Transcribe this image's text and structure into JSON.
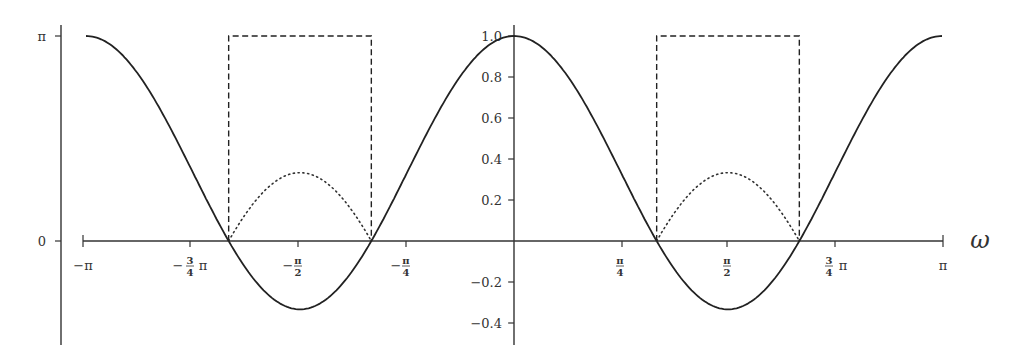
{
  "chart_data": {
    "type": "line",
    "title": "",
    "xlabel": "ω",
    "ylabel_left": "",
    "ylabel_right": "",
    "xlim": [
      -3.14159,
      3.14159
    ],
    "ylim": [
      -0.5,
      1.05
    ],
    "grid": false,
    "legend": "none",
    "x_ticks": [
      {
        "value": -3.14159,
        "label": "−π"
      },
      {
        "value": -2.35619,
        "label": "−¾π"
      },
      {
        "value": -1.5708,
        "label": "−π/2"
      },
      {
        "value": -0.7854,
        "label": "−π/4"
      },
      {
        "value": 0.7854,
        "label": "π/4"
      },
      {
        "value": 1.5708,
        "label": "π/2"
      },
      {
        "value": 2.35619,
        "label": "¾π"
      },
      {
        "value": 3.14159,
        "label": "π"
      }
    ],
    "y_ticks_right": [
      {
        "value": 1.0,
        "label": "1.0"
      },
      {
        "value": 0.8,
        "label": "0.8"
      },
      {
        "value": 0.6,
        "label": "0.6"
      },
      {
        "value": 0.4,
        "label": "0.4"
      },
      {
        "value": 0.2,
        "label": "0.2"
      },
      {
        "value": -0.2,
        "label": "-0.2"
      },
      {
        "value": -0.4,
        "label": "-0.4"
      }
    ],
    "y_ticks_left": [
      {
        "value": 1.0,
        "label": "π"
      },
      {
        "value": 0.0,
        "label": "0"
      }
    ],
    "series": [
      {
        "name": "H(ω) = (1 + 2cos 2ω)/3",
        "style": "solid",
        "x": [
          -3.14159,
          -2.61799,
          -2.0944,
          -1.5708,
          -1.0472,
          -0.5236,
          0,
          0.5236,
          1.0472,
          1.5708,
          2.0944,
          2.61799,
          3.14159
        ],
        "values": [
          1.0,
          0.667,
          0.0,
          -0.333,
          0.0,
          0.667,
          1.0,
          0.667,
          0.0,
          -0.333,
          0.0,
          0.667,
          1.0
        ]
      },
      {
        "name": "|H(ω)| (where H<0)",
        "style": "dotted",
        "x": [
          -2.0944,
          -1.8326,
          -1.5708,
          -1.309,
          -1.0472,
          1.0472,
          1.309,
          1.5708,
          1.8326,
          2.0944
        ],
        "values": [
          0.0,
          0.244,
          0.333,
          0.244,
          0.0,
          0.0,
          0.244,
          0.333,
          0.244,
          0.0
        ]
      },
      {
        "name": "phase ∠H(ω)",
        "style": "dashed",
        "x": [
          -2.0944,
          -2.0944,
          -1.0472,
          -1.0472,
          1.0472,
          1.0472,
          2.0944,
          2.0944
        ],
        "values": [
          0,
          3.14159,
          3.14159,
          0,
          0,
          3.14159,
          3.14159,
          0
        ]
      }
    ]
  },
  "labels": {
    "omega": "ω",
    "left_pi": "π",
    "left_zero": "0",
    "x_neg_pi": "−π",
    "x_neg_3_4": "3",
    "x_neg_3_4_den": "4",
    "x_pi_sym": "π",
    "x_minus": "−",
    "x_pi_num": "π",
    "x_den_2": "2",
    "x_den_4": "4",
    "y_1_0": "1.0",
    "y_0_8": "0.8",
    "y_0_6": "0.6",
    "y_0_4": "0.4",
    "y_0_2": "0.2",
    "y_m0_2": "−0.2",
    "y_m0_4": "−0.4"
  }
}
